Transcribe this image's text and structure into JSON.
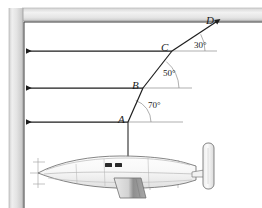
{
  "figure": {
    "background_color": "#ffffff",
    "wall": {
      "name": "vertical-wall",
      "color_light": "#f2f2f2",
      "color_mid": "#d8d8d8",
      "color_dark": "#bdbdbd"
    },
    "ceiling": {
      "name": "horizontal-ceiling",
      "color_light": "#f4f4f4",
      "color_mid": "#dcdcdc"
    },
    "points": [
      {
        "id": "A",
        "label": "A",
        "x": 128,
        "y": 122
      },
      {
        "id": "B",
        "label": "B",
        "x": 143,
        "y": 88
      },
      {
        "id": "C",
        "label": "C",
        "x": 172,
        "y": 51
      },
      {
        "id": "D",
        "label": "D",
        "x": 215,
        "y": 24
      }
    ],
    "angles": [
      {
        "at": "A",
        "label": "70°",
        "value": 70
      },
      {
        "at": "B",
        "label": "50°",
        "value": 50
      },
      {
        "at": "C",
        "label": "30°",
        "value": 30
      }
    ],
    "horizontal_rays": [
      {
        "name": "ray-to-A",
        "y": 122,
        "x_start": 24,
        "x_end": 128,
        "arrow": "left"
      },
      {
        "name": "ray-to-B",
        "y": 88,
        "x_start": 24,
        "x_end": 143,
        "arrow": "left"
      },
      {
        "name": "ray-to-C",
        "y": 51,
        "x_start": 24,
        "x_end": 172,
        "arrow": "left"
      }
    ],
    "reference_lines": [
      {
        "name": "horizontal-reference-A",
        "y": 122,
        "x_start": 128,
        "x_end": 182
      },
      {
        "name": "horizontal-reference-B",
        "y": 88,
        "x_start": 143,
        "x_end": 191
      },
      {
        "name": "horizontal-reference-C",
        "y": 51,
        "x_start": 172,
        "x_end": 216
      }
    ],
    "path_segments": [
      {
        "name": "segment-A-B",
        "from": "A",
        "to": "B"
      },
      {
        "name": "segment-B-C",
        "from": "B",
        "to": "C"
      },
      {
        "name": "segment-C-D",
        "from": "C",
        "to": "D"
      }
    ],
    "mast": {
      "name": "antenna-mast",
      "x": 128,
      "y_top": 122,
      "y_bottom": 172
    },
    "aircraft": {
      "name": "aircraft-side-view",
      "body_color": "#fdfdfd",
      "outline_color": "#6f6f6f",
      "shade_color": "#b9b9b9",
      "window_color": "#2b2b2b",
      "parts": [
        "fuselage",
        "nose-probe",
        "cockpit-windows",
        "ventral-pod",
        "wing-root",
        "vertical-stabilizer",
        "tail-boom"
      ]
    }
  }
}
